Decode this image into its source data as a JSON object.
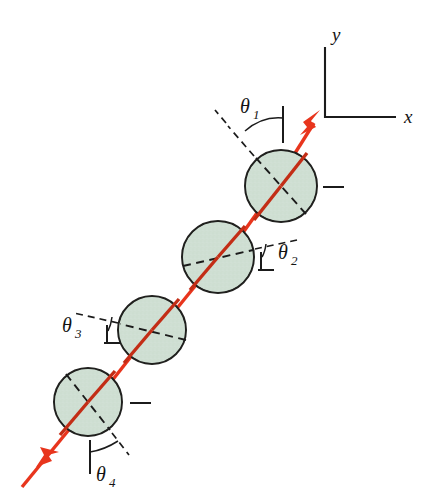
{
  "figure": {
    "background_color": "#ffffff",
    "width": 435,
    "height": 500
  },
  "colors": {
    "beam": "#e8351d",
    "beam_shadow": "#c32d16",
    "disc_fill": "#cfdfd3",
    "disc_stroke": "#20201e",
    "ink": "#1b1b1b"
  },
  "axes": {
    "y_label": "y",
    "x_label": "x",
    "origin": {
      "x": 325,
      "y": 117
    },
    "y_tip": {
      "x": 325,
      "y": 47
    },
    "x_tip": {
      "x": 396,
      "y": 117
    }
  },
  "beam": {
    "entry_label": "incident beam",
    "exit_label": "transmitted beam",
    "arrow_in_direction": "up-right",
    "arrow_out_direction": "down-left"
  },
  "polarizers": [
    {
      "id": "polarizer-1",
      "angle_label": "θ",
      "angle_subscript": "1",
      "center": {
        "x": 281,
        "y": 186
      },
      "radius": 36,
      "axis_angle_deg": 125,
      "marker_type": "arc",
      "has_edge_tick": true
    },
    {
      "id": "polarizer-2",
      "angle_label": "θ",
      "angle_subscript": "2",
      "center": {
        "x": 218,
        "y": 257
      },
      "radius": 36,
      "axis_angle_deg": 13,
      "marker_type": "bracket",
      "has_edge_tick": false
    },
    {
      "id": "polarizer-3",
      "angle_label": "θ",
      "angle_subscript": "3",
      "center": {
        "x": 152,
        "y": 330
      },
      "radius": 34,
      "axis_angle_deg": 14,
      "marker_type": "bracket",
      "has_edge_tick": false
    },
    {
      "id": "polarizer-4",
      "angle_label": "θ",
      "angle_subscript": "4",
      "center": {
        "x": 88,
        "y": 402
      },
      "radius": 34,
      "axis_angle_deg": 108,
      "marker_type": "arc",
      "has_edge_tick": true
    }
  ],
  "labels": {
    "theta1": "θ",
    "theta1_sub": "1",
    "theta2": "θ",
    "theta2_sub": "2",
    "theta3": "θ",
    "theta3_sub": "3",
    "theta4": "θ",
    "theta4_sub": "4",
    "x": "x",
    "y": "y"
  }
}
